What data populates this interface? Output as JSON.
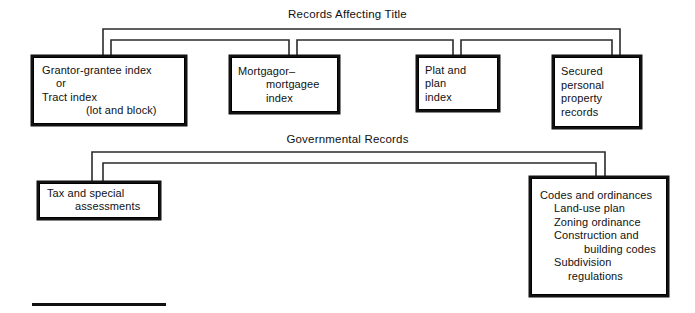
{
  "diagram": {
    "title_top": "Records Affecting Title",
    "title_bottom": "Governmental Records"
  },
  "groups": [
    {
      "id": "records-affecting-title",
      "label": "Records Affecting Title",
      "nodes": [
        {
          "id": "grantor-grantee-index",
          "lines": [
            {
              "text": "Grantor-grantee index",
              "indent": 0
            },
            {
              "text": "or",
              "indent": 1
            },
            {
              "text": "Tract index",
              "indent": 0
            },
            {
              "text": "(lot and block)",
              "indent": 3
            }
          ]
        },
        {
          "id": "mortgagor-mortgagee-index",
          "lines": [
            {
              "text": "Mortgagor–",
              "indent": 0
            },
            {
              "text": "mortgagee",
              "indent": 2
            },
            {
              "text": "index",
              "indent": 2
            }
          ]
        },
        {
          "id": "plat-and-plan-index",
          "lines": [
            {
              "text": "Plat and",
              "indent": 0
            },
            {
              "text": "plan",
              "indent": 0
            },
            {
              "text": "index",
              "indent": 0
            }
          ]
        },
        {
          "id": "secured-personal-property-records",
          "lines": [
            {
              "text": "Secured",
              "indent": 0
            },
            {
              "text": "personal",
              "indent": 0
            },
            {
              "text": "property",
              "indent": 0
            },
            {
              "text": "records",
              "indent": 0
            }
          ]
        }
      ]
    },
    {
      "id": "governmental-records",
      "label": "Governmental Records",
      "nodes": [
        {
          "id": "tax-and-special-assessments",
          "lines": [
            {
              "text": "Tax and special",
              "indent": 0
            },
            {
              "text": "assessments",
              "indent": 2
            }
          ]
        },
        {
          "id": "codes-and-ordinances",
          "lines": [
            {
              "text": "Codes and ordinances",
              "indent": 0
            },
            {
              "text": "Land-use plan",
              "indent": 1
            },
            {
              "text": "Zoning ordinance",
              "indent": 1
            },
            {
              "text": "Construction and",
              "indent": 1
            },
            {
              "text": "building codes",
              "indent": 3
            },
            {
              "text": "Subdivision",
              "indent": 1
            },
            {
              "text": "regulations",
              "indent": 2
            }
          ]
        }
      ]
    }
  ],
  "nodes": {
    "grantor": {
      "l0": "Grantor-grantee index",
      "l1": "or",
      "l2": "Tract index",
      "l3": "(lot and block)"
    },
    "mortgage": {
      "l0": "Mortgagor–",
      "l1": "mortgagee",
      "l2": "index"
    },
    "plat": {
      "l0": "Plat and",
      "l1": "plan",
      "l2": "index"
    },
    "secured": {
      "l0": "Secured",
      "l1": "personal",
      "l2": "property",
      "l3": "records"
    },
    "tax": {
      "l0": "Tax and special",
      "l1": "assessments"
    },
    "codes": {
      "l0": "Codes and ordinances",
      "l1": "Land-use plan",
      "l2": "Zoning ordinance",
      "l3": "Construction and",
      "l4": "building codes",
      "l5": "Subdivision",
      "l6": "regulations"
    }
  },
  "colors": {
    "ink": "#111111",
    "paper": "#ffffff",
    "connector": "#2b2b2b"
  }
}
